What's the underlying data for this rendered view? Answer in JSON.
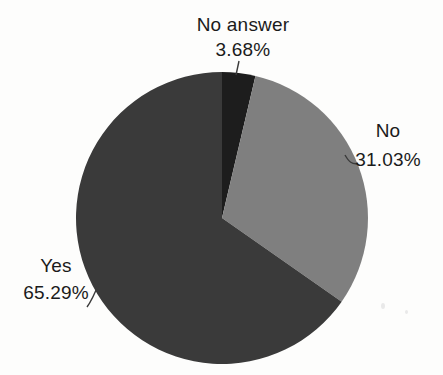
{
  "chart_data": {
    "type": "pie",
    "title": "",
    "legend": "none",
    "label_style": "outside-with-leader-lines",
    "start_angle_deg": 0,
    "direction": "clockwise",
    "background_color": "#fdfdfc",
    "text_color": "#1b1b1b",
    "leader_line_color": "#3a3a3a",
    "slices": [
      {
        "label": "No answer",
        "pct_label": "3.68%",
        "value": 3.68,
        "color": "#1d1d1d"
      },
      {
        "label": "No",
        "pct_label": "31.03%",
        "value": 31.03,
        "color": "#7f7f7f"
      },
      {
        "label": "Yes",
        "pct_label": "65.29%",
        "value": 65.29,
        "color": "#3a3a3a"
      }
    ]
  }
}
